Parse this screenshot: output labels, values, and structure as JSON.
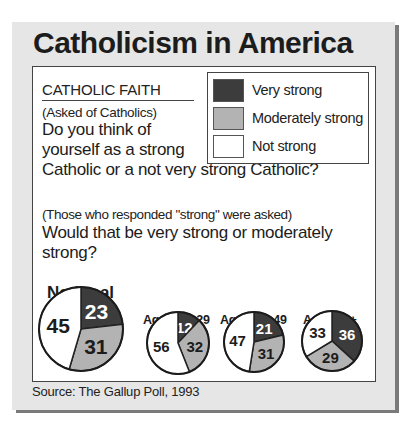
{
  "title": "Catholicism in America",
  "heading": "CATHOLIC FAITH",
  "subnote_1": "(Asked of Catholics)",
  "question_1_line1": "Do you think of yourself as a strong",
  "question_1_line2": "Catholic or a not very strong Catholic?",
  "subnote_2": "(Those who responded \"strong\" were asked)",
  "question_2": "Would that be very strong or moderately strong?",
  "legend": [
    {
      "label": "Very strong",
      "color": "#3c3c3c"
    },
    {
      "label": "Moderately strong",
      "color": "#b3b3b3"
    },
    {
      "label": "Not strong",
      "color": "#ffffff"
    }
  ],
  "national_label": "National",
  "age_labels": [
    "Ages 18–29",
    "Ages 30–49",
    "Ages 50+"
  ],
  "source": "Source: The Gallup Poll, 1993",
  "chart_data": {
    "type": "pie",
    "title": "Catholicism in America",
    "categories": [
      "Very strong",
      "Moderately strong",
      "Not strong"
    ],
    "colors": [
      "#3c3c3c",
      "#b3b3b3",
      "#ffffff"
    ],
    "series": [
      {
        "name": "National",
        "values": [
          23,
          31,
          45
        ]
      },
      {
        "name": "Ages 18–29",
        "values": [
          12,
          32,
          56
        ]
      },
      {
        "name": "Ages 30–49",
        "values": [
          21,
          31,
          47
        ]
      },
      {
        "name": "Ages 50+",
        "values": [
          36,
          29,
          33
        ]
      }
    ],
    "legend_position": "top-right",
    "source": "Source: The Gallup Poll, 1993"
  }
}
